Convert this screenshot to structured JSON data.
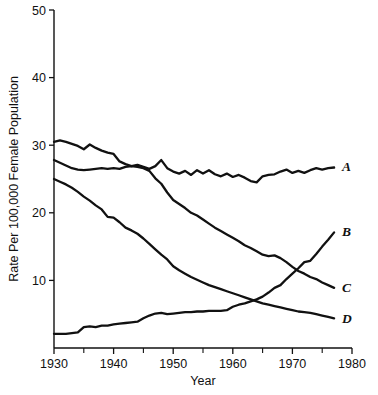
{
  "chart_data": {
    "type": "line",
    "title": "",
    "xlabel": "Year",
    "ylabel": "Rate Per 100,000 Female Population",
    "xlim": [
      1930,
      1980
    ],
    "ylim": [
      0,
      50
    ],
    "xticks": [
      1930,
      1940,
      1950,
      1960,
      1970,
      1980
    ],
    "xticklabels": [
      "1930",
      "1940",
      "1950",
      "1960",
      "1970",
      "1980"
    ],
    "xminorticks": [
      1935,
      1945,
      1955,
      1965,
      1975
    ],
    "yticks": [
      10,
      20,
      30,
      40,
      50
    ],
    "yticklabels": [
      "10",
      "20",
      "30",
      "40",
      "50"
    ],
    "grid": false,
    "legend": "inline-right-end-labels",
    "line_color": "#111111",
    "series": [
      {
        "name": "A",
        "label": "A",
        "label_x": 1977.5,
        "label_y": 26.8,
        "x": [
          1930,
          1931,
          1932,
          1933,
          1934,
          1935,
          1936,
          1937,
          1938,
          1939,
          1940,
          1941,
          1942,
          1943,
          1944,
          1945,
          1946,
          1947,
          1948,
          1949,
          1950,
          1951,
          1952,
          1953,
          1954,
          1955,
          1956,
          1957,
          1958,
          1959,
          1960,
          1961,
          1962,
          1963,
          1964,
          1965,
          1966,
          1967,
          1968,
          1969,
          1970,
          1971,
          1972,
          1973,
          1974,
          1975,
          1976,
          1977
        ],
        "y": [
          30.5,
          30.7,
          30.5,
          30.2,
          29.9,
          29.4,
          30.1,
          29.6,
          29.2,
          28.9,
          28.7,
          27.6,
          27.2,
          26.9,
          27.1,
          26.8,
          26.5,
          26.9,
          27.8,
          26.6,
          26.1,
          25.8,
          26.2,
          25.6,
          26.3,
          25.8,
          26.3,
          25.7,
          25.4,
          25.8,
          25.3,
          25.6,
          25.2,
          24.7,
          24.5,
          25.4,
          25.6,
          25.7,
          26.1,
          26.4,
          25.9,
          26.2,
          25.9,
          26.3,
          26.6,
          26.4,
          26.6,
          26.7
        ]
      },
      {
        "name": "B",
        "label": "B",
        "label_x": 1977.5,
        "label_y": 17.2,
        "x": [
          1930,
          1931,
          1932,
          1933,
          1934,
          1935,
          1936,
          1937,
          1938,
          1939,
          1940,
          1941,
          1942,
          1943,
          1944,
          1945,
          1946,
          1947,
          1948,
          1949,
          1950,
          1951,
          1952,
          1953,
          1954,
          1955,
          1956,
          1957,
          1958,
          1959,
          1960,
          1961,
          1962,
          1963,
          1964,
          1965,
          1966,
          1967,
          1968,
          1969,
          1970,
          1971,
          1972,
          1973,
          1974,
          1975,
          1976,
          1977
        ],
        "y": [
          2.1,
          2.1,
          2.1,
          2.2,
          2.3,
          3.1,
          3.2,
          3.1,
          3.3,
          3.3,
          3.5,
          3.6,
          3.7,
          3.8,
          3.9,
          4.4,
          4.8,
          5.1,
          5.2,
          5.0,
          5.1,
          5.2,
          5.3,
          5.3,
          5.4,
          5.4,
          5.5,
          5.5,
          5.5,
          5.6,
          6.1,
          6.4,
          6.6,
          6.9,
          7.2,
          7.6,
          8.2,
          8.9,
          9.3,
          10.2,
          11.0,
          11.8,
          12.7,
          12.9,
          13.9,
          15.0,
          16.0,
          17.1
        ]
      },
      {
        "name": "C",
        "label": "C",
        "label_x": 1977.5,
        "label_y": 8.9,
        "x": [
          1930,
          1931,
          1932,
          1933,
          1934,
          1935,
          1936,
          1937,
          1938,
          1939,
          1940,
          1941,
          1942,
          1943,
          1944,
          1945,
          1946,
          1947,
          1948,
          1949,
          1950,
          1951,
          1952,
          1953,
          1954,
          1955,
          1956,
          1957,
          1958,
          1959,
          1960,
          1961,
          1962,
          1963,
          1964,
          1965,
          1966,
          1967,
          1968,
          1969,
          1970,
          1971,
          1972,
          1973,
          1974,
          1975,
          1976,
          1977
        ],
        "y": [
          27.8,
          27.4,
          27.0,
          26.6,
          26.4,
          26.3,
          26.4,
          26.5,
          26.6,
          26.5,
          26.6,
          26.5,
          26.8,
          26.9,
          26.8,
          26.6,
          26.2,
          25.1,
          24.3,
          23.0,
          21.9,
          21.3,
          20.7,
          20.0,
          19.6,
          19.0,
          18.4,
          17.8,
          17.3,
          16.8,
          16.3,
          15.8,
          15.2,
          14.8,
          14.3,
          13.8,
          13.6,
          13.7,
          13.3,
          12.7,
          12.0,
          11.4,
          11.0,
          10.5,
          10.2,
          9.7,
          9.3,
          8.9
        ]
      },
      {
        "name": "D",
        "label": "D",
        "label_x": 1977.5,
        "label_y": 4.3,
        "x": [
          1930,
          1931,
          1932,
          1933,
          1934,
          1935,
          1936,
          1937,
          1938,
          1939,
          1940,
          1941,
          1942,
          1943,
          1944,
          1945,
          1946,
          1947,
          1948,
          1949,
          1950,
          1951,
          1952,
          1953,
          1954,
          1955,
          1956,
          1957,
          1958,
          1959,
          1960,
          1961,
          1962,
          1963,
          1964,
          1965,
          1966,
          1967,
          1968,
          1969,
          1970,
          1971,
          1972,
          1973,
          1974,
          1975,
          1976,
          1977
        ],
        "y": [
          25.0,
          24.6,
          24.2,
          23.7,
          23.1,
          22.4,
          21.8,
          21.1,
          20.5,
          19.4,
          19.3,
          18.6,
          17.8,
          17.4,
          16.9,
          16.2,
          15.4,
          14.6,
          13.8,
          13.1,
          12.1,
          11.5,
          11.0,
          10.5,
          10.1,
          9.7,
          9.3,
          9.0,
          8.7,
          8.4,
          8.1,
          7.8,
          7.5,
          7.2,
          6.9,
          6.6,
          6.4,
          6.2,
          6.0,
          5.8,
          5.6,
          5.4,
          5.3,
          5.2,
          5.0,
          4.8,
          4.6,
          4.4
        ]
      }
    ]
  },
  "axes": {
    "x_axis_title": "Year",
    "y_axis_title": "Rate Per 100,000 Female Population"
  }
}
